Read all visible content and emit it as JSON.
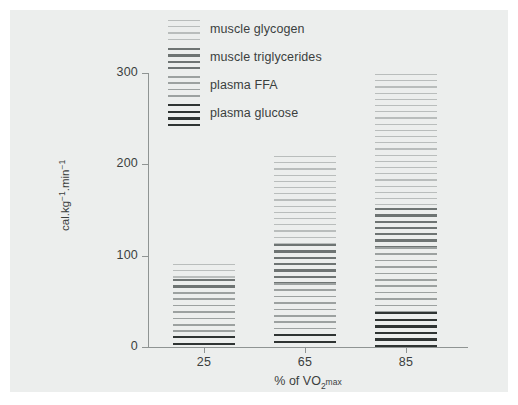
{
  "chart_data": {
    "type": "bar",
    "title": "",
    "subtitle": "",
    "xlabel": "% of VO2 max",
    "xlabel_parts": {
      "prefix": "% of VO",
      "sub": "2",
      "suffix": "max"
    },
    "ylabel": "cal.kg-1.min-1",
    "ylabel_parts": {
      "a": "cal.kg",
      "sup1": "−1",
      "b": ".min",
      "sup2": "−1"
    },
    "categories": [
      "25",
      "65",
      "85"
    ],
    "ylim": [
      0,
      300
    ],
    "yticks": [
      "0",
      "100",
      "200",
      "300"
    ],
    "ytick_values": [
      0,
      100,
      200,
      300
    ],
    "grid": false,
    "stacked": true,
    "legend_position": "top",
    "series": [
      {
        "name": "muscle glycogen",
        "pattern": "light-thin-lines",
        "color": "#b9bdbc",
        "values": [
          17,
          96,
          147
        ]
      },
      {
        "name": "muscle triglycerides",
        "pattern": "dark-thick-lines",
        "color": "#6e7473",
        "values": [
          14,
          43,
          42
        ]
      },
      {
        "name": "plasma FFA",
        "pattern": "medium-thin-lines",
        "color": "#9ca1a0",
        "values": [
          48,
          56,
          72
        ]
      },
      {
        "name": "plasma glucose",
        "pattern": "darkest-thick-lines",
        "color": "#2f3433",
        "values": [
          12,
          14,
          38
        ]
      }
    ],
    "totals": [
      91,
      209,
      299
    ]
  },
  "legend": {
    "items": [
      {
        "label": "muscle glycogen"
      },
      {
        "label": "muscle triglycerides"
      },
      {
        "label": "plasma FFA"
      },
      {
        "label": "plasma glucose"
      }
    ]
  },
  "colors": {
    "panel_background": "#eceeed",
    "page_background": "#ffffff",
    "axis": "#8f9493",
    "text": "#3b3f3e"
  }
}
